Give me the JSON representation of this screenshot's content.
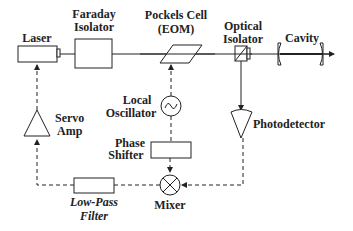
{
  "diagram": {
    "components": {
      "laser": {
        "label": "Laser"
      },
      "faraday_isolator": {
        "label_line1": "Faraday",
        "label_line2": "Isolator"
      },
      "pockels_cell": {
        "label_line1": "Pockels Cell",
        "label_line2": "(EOM)"
      },
      "optical_isolator": {
        "label_line1": "Optical",
        "label_line2": "Isolator"
      },
      "cavity": {
        "label": "Cavity"
      },
      "local_oscillator": {
        "label_line1": "Local",
        "label_line2": "Oscillator"
      },
      "photodetector": {
        "label": "Photodetector"
      },
      "phase_shifter": {
        "label_line1": "Phase",
        "label_line2": "Shifter"
      },
      "mixer": {
        "label": "Mixer"
      },
      "low_pass_filter": {
        "label_line1": "Low-Pass",
        "label_line2": "Filter"
      },
      "servo_amp": {
        "label_line1": "Servo",
        "label_line2": "Amp"
      }
    },
    "colors": {
      "stroke": "#222222",
      "background": "#ffffff"
    }
  }
}
